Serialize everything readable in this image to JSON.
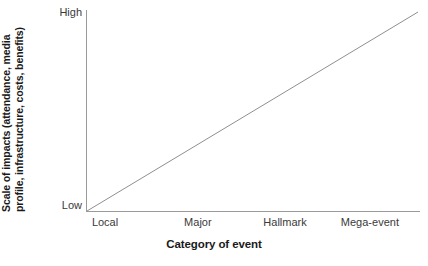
{
  "chart_data": {
    "type": "line",
    "title": "",
    "xlabel": "Category of event",
    "ylabel_line1": "Scale of impacts (attendance, media",
    "ylabel_line2": "profile, infrastructure, costs, benefits)",
    "ylabel": "Scale of impacts (attendance, media profile, infrastructure, costs, benefits)",
    "categories": [
      "Local",
      "Major",
      "Hallmark",
      "Mega-event"
    ],
    "x": [
      1,
      2,
      3,
      4
    ],
    "values": [
      0,
      33,
      67,
      100
    ],
    "ytick_labels": [
      "High",
      "Low"
    ],
    "ylim": [
      0,
      100
    ],
    "ytick_values": [
      100,
      0
    ],
    "grid": false,
    "legend": null,
    "legend_position": "none",
    "series": [
      {
        "name": "Scale of impacts",
        "values": [
          0,
          33,
          67,
          100
        ],
        "color": "#8f8f8f",
        "linewidth": 1
      }
    ],
    "annotations": [],
    "axis_color": "#9a9a9a",
    "line_color": "#8f8f8f",
    "text_color": "#1a1a1a",
    "background": "#ffffff"
  },
  "axes": {
    "y": {
      "title_line1": "Scale of impacts (attendance, media",
      "title_line2": "profile, infrastructure, costs, benefits)",
      "tick_high": "High",
      "tick_low": "Low"
    },
    "x": {
      "title": "Category of event",
      "ticks": [
        {
          "label": "Local",
          "pos_pct": 5.7
        },
        {
          "label": "Major",
          "pos_pct": 33.5
        },
        {
          "label": "Hallmark",
          "pos_pct": 59.6
        },
        {
          "label": "Mega-event",
          "pos_pct": 85.0
        }
      ]
    }
  }
}
